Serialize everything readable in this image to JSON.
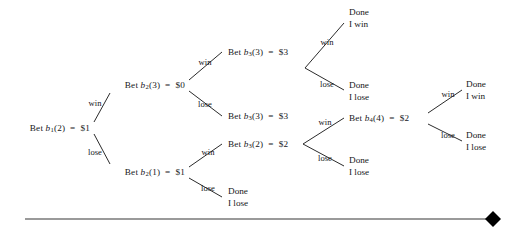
{
  "figure": {
    "type": "decision-tree",
    "background_color": "#ffffff",
    "line_color": "#2b2b2b",
    "text_color": "#16171a",
    "rule_color": "#9a9a9a",
    "marker_color": "#000000"
  },
  "nodes": [
    {
      "id": "n1",
      "text_html": "Bet <var>b</var><sub>1</sub>(2)&nbsp; =&nbsp; $1",
      "plain": "Bet b1(2) = $1",
      "bet_label": "b1(2)",
      "amount": "$1",
      "x": 90,
      "y": 128,
      "align": "r"
    },
    {
      "id": "n2",
      "text_html": "Bet <var>b</var><sub>2</sub>(3)&nbsp; =&nbsp; $0",
      "plain": "Bet b2(3) = $0",
      "bet_label": "b2(3)",
      "amount": "$0",
      "x": 185,
      "y": 85,
      "align": "r"
    },
    {
      "id": "n3",
      "text_html": "Bet <var>b</var><sub>2</sub>(1)&nbsp; =&nbsp; $1",
      "plain": "Bet b2(1) = $1",
      "bet_label": "b2(1)",
      "amount": "$1",
      "x": 185,
      "y": 172,
      "align": "r"
    },
    {
      "id": "n4",
      "text_html": "Bet <var>b</var><sub>3</sub>(3)&nbsp; =&nbsp; $3",
      "plain": "Bet b3(3) = $3",
      "bet_label": "b3(3)",
      "amount": "$3",
      "x": 234,
      "y": 52,
      "align": "l"
    },
    {
      "id": "n5",
      "text_html": "Bet <var>b</var><sub>3</sub>(3)&nbsp; =&nbsp; $3",
      "plain": "Bet b3(3) = $3",
      "bet_label": "b3(3)",
      "amount": "$3",
      "x": 234,
      "y": 116,
      "align": "l"
    },
    {
      "id": "n6",
      "text_html": "Bet <var>b</var><sub>3</sub>(2)&nbsp; =&nbsp; $2",
      "plain": "Bet b3(2) = $2",
      "bet_label": "b3(2)",
      "amount": "$2",
      "x": 234,
      "y": 144,
      "align": "l"
    },
    {
      "id": "n7",
      "text_html": "Bet <var>b</var><sub>4</sub>(4)&nbsp; =&nbsp; $2",
      "plain": "Bet b4(4) = $2",
      "bet_label": "b4(4)",
      "amount": "$2",
      "x": 355,
      "y": 118,
      "align": "l"
    }
  ],
  "terminals": [
    {
      "id": "t1",
      "line1": "Done",
      "line2": "I win",
      "x": 355,
      "y": 18
    },
    {
      "id": "t2",
      "line1": "Done",
      "line2": "I lose",
      "x": 355,
      "y": 91
    },
    {
      "id": "t3",
      "line1": "Done",
      "line2": "I lose",
      "x": 355,
      "y": 166
    },
    {
      "id": "t4",
      "line1": "Done",
      "line2": "I lose",
      "x": 234,
      "y": 197
    },
    {
      "id": "t5",
      "line1": "Done",
      "line2": "I win",
      "x": 472,
      "y": 90
    },
    {
      "id": "t6",
      "line1": "Done",
      "line2": "I lose",
      "x": 472,
      "y": 141
    }
  ],
  "edges": [
    {
      "from": "n1",
      "to": "n2",
      "label": "win",
      "lx": 95,
      "ly": 103
    },
    {
      "from": "n1",
      "to": "n3",
      "label": "lose",
      "lx": 95,
      "ly": 152
    },
    {
      "from": "n2",
      "to": "n4",
      "label": "win",
      "lx": 205,
      "ly": 62
    },
    {
      "from": "n2",
      "to": "n5",
      "label": "lose",
      "lx": 205,
      "ly": 104
    },
    {
      "from": "n3",
      "to": "n6",
      "label": "win",
      "lx": 208,
      "ly": 152
    },
    {
      "from": "n3",
      "to": "t4",
      "label": "lose",
      "lx": 208,
      "ly": 188
    },
    {
      "from": "n4",
      "to": "t1",
      "label": "win",
      "lx": 327,
      "ly": 42
    },
    {
      "from": "n4",
      "to": "t2",
      "label": "lose",
      "lx": 327,
      "ly": 84
    },
    {
      "from": "n6",
      "to": "n7",
      "label": "win",
      "lx": 325,
      "ly": 122
    },
    {
      "from": "n6",
      "to": "t3",
      "label": "lose",
      "lx": 325,
      "ly": 158
    },
    {
      "from": "n7",
      "to": "t5",
      "label": "win",
      "lx": 448,
      "ly": 94
    },
    {
      "from": "n7",
      "to": "t6",
      "label": "lose",
      "lx": 448,
      "ly": 135
    }
  ],
  "footer_rule": {
    "name": "horizontal-rule",
    "x_start": 25,
    "x_end": 490,
    "y": 219,
    "marker": "diamond",
    "marker_x": 493
  }
}
